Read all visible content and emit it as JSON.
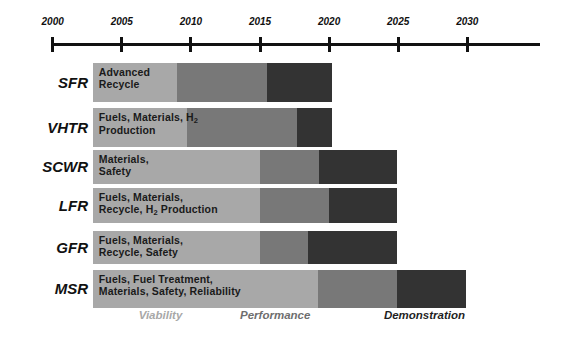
{
  "chart_data": {
    "type": "bar",
    "title": "",
    "subtitle": "",
    "xlabel": "",
    "ylabel": "",
    "orientation": "horizontal",
    "grid": false,
    "legend_position": "bottom",
    "axis": {
      "start_year": 2000,
      "end_year": 2035,
      "tick_labels": [
        "2000",
        "2005",
        "2010",
        "2015",
        "2020",
        "2025",
        "2030"
      ],
      "tick_years": [
        2000,
        2005,
        2010,
        2015,
        2020,
        2025,
        2030
      ],
      "xlim": [
        2000,
        2035
      ]
    },
    "phases": [
      {
        "key": "viability",
        "label": "Viability",
        "color": "#a8a8a8"
      },
      {
        "key": "performance",
        "label": "Performance",
        "color": "#787878"
      },
      {
        "key": "demonstration",
        "label": "Demonstration",
        "color": "#333333"
      }
    ],
    "categories": [
      "SFR",
      "VHTR",
      "SCWR",
      "LFR",
      "GFR",
      "MSR"
    ],
    "rows": [
      {
        "label": "SFR",
        "text": "Advanced\nRecycle",
        "text_html": "Advanced<br>Recycle",
        "start": 2002.9,
        "viability_end": 2009.0,
        "performance_end": 2015.5,
        "demonstration_end": 2020.2
      },
      {
        "label": "VHTR",
        "text": "Fuels, Materials, H2\nProduction",
        "text_html": "Fuels, Materials, H<sub>2</sub><br>Production",
        "start": 2002.9,
        "viability_end": 2009.7,
        "performance_end": 2017.7,
        "demonstration_end": 2020.2
      },
      {
        "label": "SCWR",
        "text": "Materials,\nSafety",
        "text_html": "Materials,<br>Safety",
        "start": 2002.9,
        "viability_end": 2015.0,
        "performance_end": 2019.3,
        "demonstration_end": 2024.9
      },
      {
        "label": "LFR",
        "text": "Fuels, Materials,\nRecycle, H2 Production",
        "text_html": "Fuels, Materials,<br>Recycle, H<sub>2</sub> Production",
        "start": 2002.9,
        "viability_end": 2015.0,
        "performance_end": 2020.0,
        "demonstration_end": 2024.9
      },
      {
        "label": "GFR",
        "text": "Fuels, Materials,\nRecycle, Safety",
        "text_html": "Fuels, Materials,<br>Recycle, Safety",
        "start": 2002.9,
        "viability_end": 2015.0,
        "performance_end": 2018.5,
        "demonstration_end": 2024.9
      },
      {
        "label": "MSR",
        "text": "Fuels, Fuel Treatment,\nMaterials, Safety, Reliability",
        "text_html": "Fuels, Fuel Treatment,<br>Materials, Safety, Reliability",
        "start": 2002.9,
        "viability_end": 2019.2,
        "performance_end": 2024.9,
        "demonstration_end": 2029.9
      }
    ],
    "legend": [
      {
        "label": "Viability",
        "color": "#a8a8a8",
        "x_year": 2007.8
      },
      {
        "label": "Performance",
        "color": "#787878",
        "x_year": 2016.1
      },
      {
        "label": "Demonstration",
        "color": "#333333",
        "x_year": 2026.9
      }
    ]
  },
  "colors": {
    "viability": "#a8a8a8",
    "performance": "#787878",
    "demonstration": "#333333",
    "axis": "#111111",
    "background": "#ffffff"
  }
}
